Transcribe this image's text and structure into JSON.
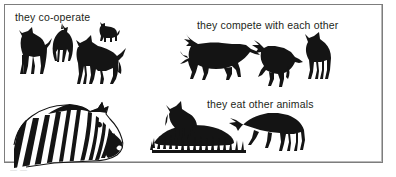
{
  "figure": {
    "background_color": "#ffffff",
    "frame_color": "#7d7d7d",
    "ink_color": "#141414",
    "captions": {
      "cooperate": "they co-operate",
      "compete": "they compete with each other",
      "eat": "they eat other animals"
    },
    "groups": {
      "cooperate": {
        "name": "wild dogs co-operating",
        "animal_count": 4,
        "animals": [
          "dog-standing-left",
          "dog-rear-view",
          "dog-large-facing-front-left",
          "dog-small-distant"
        ]
      },
      "compete": {
        "name": "wild dogs competing",
        "animal_count": 3,
        "animals": [
          "dog-lunging-left",
          "dog-crouching-tussle",
          "dog-standing-upright"
        ]
      },
      "eat": {
        "name": "wild dogs feeding on carcass",
        "animal_count": 2,
        "animals": [
          "dog-standing-on-carcass",
          "dog-head-down-feeding"
        ],
        "scenery": [
          "carcass",
          "grass-tufts"
        ]
      },
      "zebra": {
        "name": "zebra head in profile",
        "animal_count": 1,
        "animals": [
          "zebra-head-profile-right"
        ]
      }
    },
    "scan_artifact": "— —"
  }
}
